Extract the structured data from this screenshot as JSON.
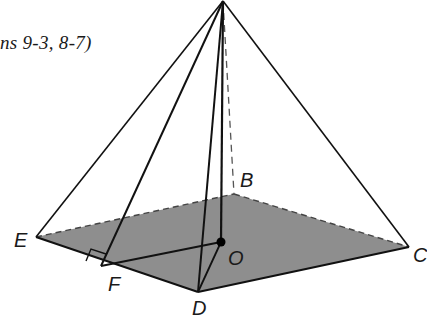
{
  "caption": "ns 9-3, 8-7)",
  "diagram": {
    "type": "square pyramid",
    "base_fill": "#8e8e8e",
    "line_color": "#111111",
    "vertices": {
      "A": {
        "x": 223,
        "y": 1
      },
      "B": {
        "x": 234,
        "y": 194
      },
      "C": {
        "x": 409,
        "y": 247
      },
      "D": {
        "x": 198,
        "y": 292
      },
      "E": {
        "x": 36,
        "y": 237
      },
      "F": {
        "x": 101,
        "y": 266
      },
      "O": {
        "x": 221,
        "y": 242
      }
    },
    "labels": {
      "B": "B",
      "C": "C",
      "D": "D",
      "E": "E",
      "F": "F",
      "O": "O"
    }
  }
}
